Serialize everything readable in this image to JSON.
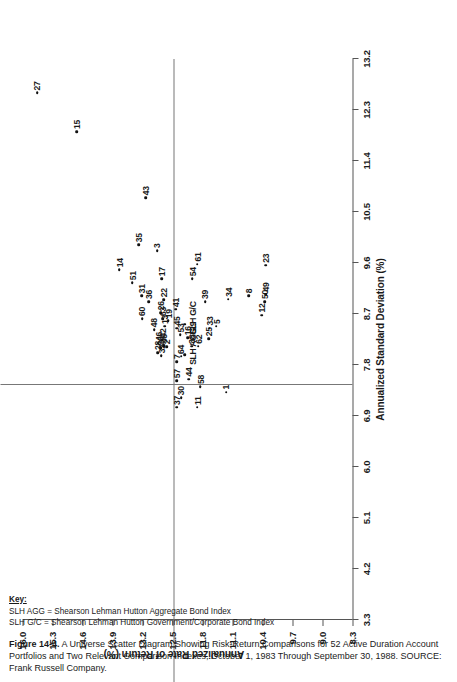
{
  "figure": {
    "caption_bold": "Figure 14-4.",
    "caption_text": " A Universe Scatter Diagram Showing Risk-Return Comparisons for 52 Active Duration Account Portfolios and Two Relevant Comparison Indexes, October 1, 1983 Through September 30, 1988. SOURCE: Frank Russell Company."
  },
  "key": {
    "title": "Key:",
    "lines": [
      "SLH AGG = Shearson Lehman Hutton Aggregate Bond Index",
      "SLH G/C  = Shearson Lehman Hutton Government/Corporate Bond Index"
    ]
  },
  "chart_data": {
    "type": "scatter",
    "title": "A Universe Scatter Diagram Showing Risk-Return Comparisons for 52 Active Duration Account Portfolios and Two Relevant Comparison Indexes",
    "xlabel": "Annualized Standard Deviation (%)",
    "ylabel": "Annualized Rate of Return (%)",
    "xlim": [
      3.3,
      13.2
    ],
    "ylim": [
      8.3,
      16.0
    ],
    "xticks": [
      3.3,
      4.2,
      5.1,
      6.0,
      6.9,
      7.8,
      8.7,
      9.6,
      10.5,
      11.4,
      12.3,
      13.2
    ],
    "yticks": [
      8.3,
      9.0,
      9.7,
      10.4,
      11.1,
      11.8,
      12.5,
      13.2,
      13.9,
      14.6,
      15.3,
      16.0
    ],
    "grid": false,
    "legend": "none",
    "median_lines": {
      "x": 7.45,
      "y": 12.48
    },
    "points": [
      {
        "label": "27",
        "x": 12.6,
        "y": 15.66
      },
      {
        "label": "15",
        "x": 11.92,
        "y": 14.73
      },
      {
        "label": "14",
        "x": 9.48,
        "y": 13.74
      },
      {
        "label": "51",
        "x": 9.25,
        "y": 13.44
      },
      {
        "label": "35",
        "x": 9.92,
        "y": 13.29
      },
      {
        "label": "31",
        "x": 9.02,
        "y": 13.22
      },
      {
        "label": "43",
        "x": 10.75,
        "y": 13.12
      },
      {
        "label": "3",
        "x": 9.82,
        "y": 12.86
      },
      {
        "label": "60",
        "x": 8.62,
        "y": 13.21
      },
      {
        "label": "36",
        "x": 8.92,
        "y": 13.06
      },
      {
        "label": "17",
        "x": 9.32,
        "y": 12.75
      },
      {
        "label": "22",
        "x": 8.95,
        "y": 12.7
      },
      {
        "label": "48",
        "x": 8.42,
        "y": 12.93
      },
      {
        "label": "28",
        "x": 8.02,
        "y": 12.85
      },
      {
        "label": "46",
        "x": 8.18,
        "y": 12.83
      },
      {
        "label": "32",
        "x": 7.96,
        "y": 12.76
      },
      {
        "label": "20",
        "x": 8.1,
        "y": 12.77
      },
      {
        "label": "56",
        "x": 8.14,
        "y": 12.7
      },
      {
        "label": "42",
        "x": 8.24,
        "y": 12.74
      },
      {
        "label": "2",
        "x": 8.12,
        "y": 12.64
      },
      {
        "label": "13",
        "x": 8.48,
        "y": 12.68
      },
      {
        "label": "63",
        "x": 8.62,
        "y": 12.73
      },
      {
        "label": "26",
        "x": 8.72,
        "y": 12.77
      },
      {
        "label": "19",
        "x": 8.58,
        "y": 12.6
      },
      {
        "label": "37",
        "x": 7.05,
        "y": 12.4
      },
      {
        "label": "57",
        "x": 7.52,
        "y": 12.4
      },
      {
        "label": "30",
        "x": 7.22,
        "y": 12.3
      },
      {
        "label": "7",
        "x": 7.86,
        "y": 12.4
      },
      {
        "label": "64",
        "x": 7.95,
        "y": 12.3
      },
      {
        "label": "45",
        "x": 8.45,
        "y": 12.4
      },
      {
        "label": "53",
        "x": 8.33,
        "y": 12.32
      },
      {
        "label": "44",
        "x": 7.55,
        "y": 12.12
      },
      {
        "label": "16",
        "x": 8.28,
        "y": 12.14
      },
      {
        "label": "38",
        "x": 8.13,
        "y": 12.05
      },
      {
        "label": "29",
        "x": 8.36,
        "y": 12.03
      },
      {
        "label": "11",
        "x": 7.05,
        "y": 11.92
      },
      {
        "label": "58",
        "x": 7.42,
        "y": 11.85
      },
      {
        "label": "62",
        "x": 8.13,
        "y": 11.9
      },
      {
        "label": "25",
        "x": 8.26,
        "y": 11.66
      },
      {
        "label": "33",
        "x": 8.45,
        "y": 11.64
      },
      {
        "label": "39",
        "x": 8.92,
        "y": 11.74
      },
      {
        "label": "5",
        "x": 8.48,
        "y": 11.48
      },
      {
        "label": "1",
        "x": 7.32,
        "y": 11.25
      },
      {
        "label": "34",
        "x": 8.96,
        "y": 11.2
      },
      {
        "label": "8",
        "x": 9.02,
        "y": 10.72
      },
      {
        "label": "12",
        "x": 8.68,
        "y": 10.42
      },
      {
        "label": "50",
        "x": 8.92,
        "y": 10.35
      },
      {
        "label": "49",
        "x": 9.05,
        "y": 10.32
      },
      {
        "label": "23",
        "x": 9.56,
        "y": 10.33
      },
      {
        "label": "54",
        "x": 9.32,
        "y": 12.04
      },
      {
        "label": "61",
        "x": 9.58,
        "y": 11.92
      },
      {
        "label": "41",
        "x": 8.78,
        "y": 12.42
      },
      {
        "label": "SLH AGG",
        "x": 7.98,
        "y": 12.21
      },
      {
        "label": "SLH G/C",
        "x": 8.52,
        "y": 12.22
      }
    ]
  }
}
